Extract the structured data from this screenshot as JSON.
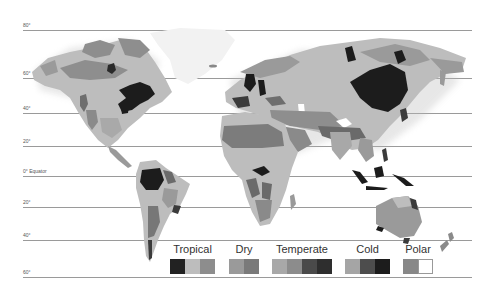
{
  "map": {
    "type": "Köppen-style world climate map (grayscale)",
    "latitudes": [
      {
        "label": "80°",
        "y": 30
      },
      {
        "label": "60°",
        "y": 78
      },
      {
        "label": "40°",
        "y": 113
      },
      {
        "label": "20°",
        "y": 146
      },
      {
        "label": "0° Equator",
        "y": 176
      },
      {
        "label": "20°",
        "y": 207
      },
      {
        "label": "40°",
        "y": 240
      },
      {
        "label": "60°",
        "y": 277
      }
    ],
    "colors": {
      "line": "#9a9a9a",
      "label": "#555555",
      "land_light": "#c8c8c8",
      "land_mid": "#9c9c9c",
      "land_dark": "#6e6e6e",
      "land_black": "#1e1e1e",
      "ice": "#f4f4f4"
    }
  },
  "legend": {
    "groups": [
      {
        "label": "Tropical",
        "swatches": [
          "#222222",
          "#bdbdbd",
          "#8d8d8d"
        ]
      },
      {
        "label": "Dry",
        "swatches": [
          "#9a9a9a",
          "#7a7a7a"
        ]
      },
      {
        "label": "Temperate",
        "swatches": [
          "#a8a8a8",
          "#8c8c8c",
          "#4a4a4a",
          "#2e2e2e"
        ]
      },
      {
        "label": "Cold",
        "swatches": [
          "#a5a5a5",
          "#4d4d4d",
          "#1c1c1c"
        ]
      },
      {
        "label": "Polar",
        "swatches": [
          "#888888",
          "#ffffff"
        ]
      }
    ]
  }
}
